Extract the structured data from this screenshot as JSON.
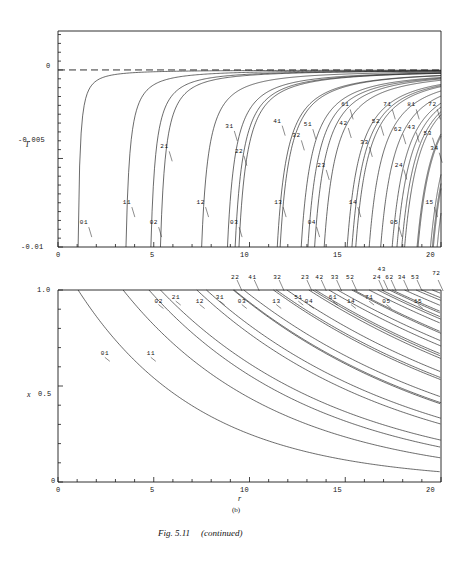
{
  "figure": {
    "caption_main": "Fig. 5.11",
    "caption_suffix": "(continued)",
    "panel_letter": "(b)"
  },
  "panel_top": {
    "name": "energy-panel",
    "ylabel": "T",
    "yticks": [
      "0",
      "-0.005",
      "-0.01"
    ],
    "ytick_values": [
      0,
      -0.005,
      -0.01
    ],
    "ylim": [
      -0.01,
      0.0022
    ],
    "xticks": [
      "0",
      "5",
      "10",
      "15",
      "20"
    ],
    "xtick_values": [
      0,
      5,
      10,
      15,
      20
    ],
    "xlim": [
      0,
      20
    ],
    "zero_line": "dashed",
    "curve_labels": [
      "01",
      "11",
      "21",
      "02",
      "12",
      "31",
      "22",
      "03",
      "41",
      "13",
      "51",
      "32",
      "04",
      "42",
      "23",
      "61",
      "52",
      "33",
      "14",
      "71",
      "24",
      "05",
      "62",
      "43",
      "81",
      "34",
      "53",
      "15",
      "72"
    ]
  },
  "panel_bottom": {
    "name": "x-panel",
    "ylabel": "x",
    "yticks": [
      "1.0",
      "0.5",
      "0"
    ],
    "ytick_values": [
      1.0,
      0.5,
      0
    ],
    "ylim": [
      0,
      1.0
    ],
    "xlabel": "r",
    "xticks": [
      "0",
      "5",
      "10",
      "15",
      "20"
    ],
    "xtick_values": [
      0,
      5,
      10,
      15,
      20
    ],
    "xlim": [
      0,
      20
    ],
    "curve_labels": [
      "01",
      "11",
      "02",
      "21",
      "12",
      "31",
      "22",
      "41",
      "03",
      "13",
      "32",
      "51",
      "23",
      "42",
      "04",
      "61",
      "33",
      "52",
      "14",
      "71",
      "43",
      "24",
      "62",
      "05",
      "34",
      "53",
      "15",
      "72"
    ]
  },
  "chart_data": [
    {
      "type": "line",
      "title": "",
      "xlabel": "",
      "ylabel": "T",
      "xlim": [
        0,
        20
      ],
      "ylim": [
        -0.01,
        0.0022
      ],
      "grid": false,
      "legend": "inline-curve-labels",
      "xticks": [
        0,
        5,
        10,
        15,
        20
      ],
      "yticks": [
        0,
        -0.005,
        -0.01
      ],
      "annotations": [
        {
          "text": "01",
          "x": 1.45,
          "y": -0.00865
        },
        {
          "text": "11",
          "x": 3.7,
          "y": -0.00752
        },
        {
          "text": "21",
          "x": 5.65,
          "y": -0.00437
        },
        {
          "text": "02",
          "x": 5.1,
          "y": -0.00865
        },
        {
          "text": "12",
          "x": 7.55,
          "y": -0.00752
        },
        {
          "text": "31",
          "x": 9.05,
          "y": -0.00322
        },
        {
          "text": "22",
          "x": 9.55,
          "y": -0.00462
        },
        {
          "text": "03",
          "x": 9.3,
          "y": -0.00865
        },
        {
          "text": "41",
          "x": 11.55,
          "y": -0.00292
        },
        {
          "text": "13",
          "x": 11.6,
          "y": -0.00752
        },
        {
          "text": "51",
          "x": 13.15,
          "y": -0.00312
        },
        {
          "text": "32",
          "x": 12.55,
          "y": -0.00375
        },
        {
          "text": "04",
          "x": 13.35,
          "y": -0.00865
        },
        {
          "text": "42",
          "x": 15.0,
          "y": -0.00305
        },
        {
          "text": "23",
          "x": 13.85,
          "y": -0.00542
        },
        {
          "text": "61",
          "x": 15.1,
          "y": -0.002
        },
        {
          "text": "52",
          "x": 16.7,
          "y": -0.00292
        },
        {
          "text": "33",
          "x": 16.1,
          "y": -0.00412
        },
        {
          "text": "14",
          "x": 15.5,
          "y": -0.00752
        },
        {
          "text": "71",
          "x": 17.3,
          "y": -0.002
        },
        {
          "text": "24",
          "x": 17.9,
          "y": -0.0054
        },
        {
          "text": "05",
          "x": 17.65,
          "y": -0.00865
        },
        {
          "text": "62",
          "x": 17.85,
          "y": -0.0034
        },
        {
          "text": "43",
          "x": 18.55,
          "y": -0.0033
        },
        {
          "text": "81",
          "x": 18.55,
          "y": -0.002
        },
        {
          "text": "34",
          "x": 19.75,
          "y": -0.00445
        },
        {
          "text": "53",
          "x": 19.4,
          "y": -0.0036
        },
        {
          "text": "15",
          "x": 19.5,
          "y": -0.00752
        },
        {
          "text": "72",
          "x": 19.65,
          "y": -0.002
        }
      ],
      "series": [
        {
          "name": "01",
          "r0": 1.05,
          "plateau": 19.9
        },
        {
          "name": "11",
          "r0": 3.55,
          "plateau": 19.9
        },
        {
          "name": "21",
          "r0": 5.35,
          "plateau": 19.9
        },
        {
          "name": "02",
          "r0": 4.85,
          "plateau": 19.9
        },
        {
          "name": "12",
          "r0": 7.5,
          "plateau": 19.9
        },
        {
          "name": "31",
          "r0": 8.85,
          "plateau": 19.9
        },
        {
          "name": "22",
          "r0": 9.45,
          "plateau": 19.9
        },
        {
          "name": "03",
          "r0": 9.25,
          "plateau": 19.9
        },
        {
          "name": "41",
          "r0": 11.45,
          "plateau": 19.9
        },
        {
          "name": "13",
          "r0": 11.6,
          "plateau": 19.9
        },
        {
          "name": "51",
          "r0": 13.05,
          "plateau": 19.9
        },
        {
          "name": "32",
          "r0": 12.7,
          "plateau": 19.9
        },
        {
          "name": "04",
          "r0": 13.4,
          "plateau": 19.9
        },
        {
          "name": "42",
          "r0": 15.1,
          "plateau": 19.9
        },
        {
          "name": "23",
          "r0": 13.9,
          "plateau": 19.9
        },
        {
          "name": "61",
          "r0": 15.35,
          "plateau": 19.9
        },
        {
          "name": "52",
          "r0": 16.85,
          "plateau": 19.9
        },
        {
          "name": "33",
          "r0": 16.25,
          "plateau": 19.9
        },
        {
          "name": "14",
          "r0": 15.55,
          "plateau": 19.9
        },
        {
          "name": "71",
          "r0": 17.45,
          "plateau": 19.9
        },
        {
          "name": "24",
          "r0": 17.95,
          "plateau": 19.9
        },
        {
          "name": "05",
          "r0": 17.7,
          "plateau": 19.9
        },
        {
          "name": "62",
          "r0": 18.1,
          "plateau": 19.9
        },
        {
          "name": "43",
          "r0": 18.75,
          "plateau": 19.9
        },
        {
          "name": "81",
          "r0": 18.8,
          "plateau": 19.9
        },
        {
          "name": "34",
          "r0": 19.6,
          "plateau": 19.9
        },
        {
          "name": "53",
          "r0": 19.45,
          "plateau": 19.9
        },
        {
          "name": "15",
          "r0": 19.55,
          "plateau": 19.9
        },
        {
          "name": "72",
          "r0": 19.8,
          "plateau": 19.9
        }
      ]
    },
    {
      "type": "line",
      "title": "",
      "xlabel": "r",
      "ylabel": "x",
      "xlim": [
        0,
        20
      ],
      "ylim": [
        0,
        1.0
      ],
      "grid": false,
      "legend": "inline-curve-labels",
      "xticks": [
        0,
        5,
        10,
        15,
        20
      ],
      "yticks": [
        0,
        0.5,
        1.0
      ],
      "annotations": [
        {
          "text": "01",
          "x": 2.55,
          "y": 0.665
        },
        {
          "text": "11",
          "x": 4.95,
          "y": 0.665
        },
        {
          "text": "02",
          "x": 5.35,
          "y": 0.94
        },
        {
          "text": "21",
          "x": 6.25,
          "y": 0.958
        },
        {
          "text": "12",
          "x": 7.5,
          "y": 0.94
        },
        {
          "text": "31",
          "x": 8.55,
          "y": 0.958
        },
        {
          "text": "22",
          "x": 9.35,
          "y": 1.0
        },
        {
          "text": "41",
          "x": 10.25,
          "y": 1.0
        },
        {
          "text": "03",
          "x": 9.7,
          "y": 0.94
        },
        {
          "text": "13",
          "x": 11.5,
          "y": 0.94
        },
        {
          "text": "32",
          "x": 11.55,
          "y": 1.0
        },
        {
          "text": "51",
          "x": 12.65,
          "y": 0.958
        },
        {
          "text": "23",
          "x": 13.0,
          "y": 1.0
        },
        {
          "text": "42",
          "x": 13.75,
          "y": 1.0
        },
        {
          "text": "04",
          "x": 13.2,
          "y": 0.94
        },
        {
          "text": "61",
          "x": 14.45,
          "y": 0.958
        },
        {
          "text": "33",
          "x": 14.55,
          "y": 1.0
        },
        {
          "text": "52",
          "x": 15.35,
          "y": 1.0
        },
        {
          "text": "14",
          "x": 15.4,
          "y": 0.94
        },
        {
          "text": "71",
          "x": 16.35,
          "y": 0.958
        },
        {
          "text": "43",
          "x": 17.0,
          "y": 1.04
        },
        {
          "text": "24",
          "x": 16.75,
          "y": 1.0
        },
        {
          "text": "62",
          "x": 17.4,
          "y": 1.0
        },
        {
          "text": "05",
          "x": 17.25,
          "y": 0.94
        },
        {
          "text": "34",
          "x": 18.05,
          "y": 1.0
        },
        {
          "text": "53",
          "x": 18.75,
          "y": 1.0
        },
        {
          "text": "15",
          "x": 18.9,
          "y": 0.94
        },
        {
          "text": "72",
          "x": 19.85,
          "y": 1.02
        }
      ],
      "series": [
        {
          "name": "01",
          "r0": 1.05,
          "decay": 0.155
        },
        {
          "name": "11",
          "r0": 3.4,
          "decay": 0.125
        },
        {
          "name": "02",
          "r0": 4.75,
          "decay": 0.112
        },
        {
          "name": "21",
          "r0": 5.35,
          "decay": 0.104
        },
        {
          "name": "12",
          "r0": 7.25,
          "decay": 0.094
        },
        {
          "name": "31",
          "r0": 7.75,
          "decay": 0.09
        },
        {
          "name": "22",
          "r0": 9.15,
          "decay": 0.083
        },
        {
          "name": "41",
          "r0": 9.7,
          "decay": 0.079
        },
        {
          "name": "03",
          "r0": 9.2,
          "decay": 0.082
        },
        {
          "name": "13",
          "r0": 11.4,
          "decay": 0.071
        },
        {
          "name": "32",
          "r0": 11.25,
          "decay": 0.072
        },
        {
          "name": "51",
          "r0": 11.95,
          "decay": 0.069
        },
        {
          "name": "23",
          "r0": 13.1,
          "decay": 0.064
        },
        {
          "name": "42",
          "r0": 13.45,
          "decay": 0.062
        },
        {
          "name": "04",
          "r0": 13.3,
          "decay": 0.063
        },
        {
          "name": "61",
          "r0": 14.15,
          "decay": 0.059
        },
        {
          "name": "33",
          "r0": 14.6,
          "decay": 0.057
        },
        {
          "name": "52",
          "r0": 15.35,
          "decay": 0.055
        },
        {
          "name": "14",
          "r0": 15.45,
          "decay": 0.054
        },
        {
          "name": "71",
          "r0": 16.25,
          "decay": 0.051
        },
        {
          "name": "43",
          "r0": 16.9,
          "decay": 0.049
        },
        {
          "name": "24",
          "r0": 16.7,
          "decay": 0.05
        },
        {
          "name": "62",
          "r0": 17.45,
          "decay": 0.047
        },
        {
          "name": "05",
          "r0": 17.3,
          "decay": 0.048
        },
        {
          "name": "34",
          "r0": 18.1,
          "decay": 0.045
        },
        {
          "name": "53",
          "r0": 18.7,
          "decay": 0.043
        },
        {
          "name": "15",
          "r0": 19.0,
          "decay": 0.042
        },
        {
          "name": "72",
          "r0": 19.55,
          "decay": 0.04
        }
      ]
    }
  ]
}
